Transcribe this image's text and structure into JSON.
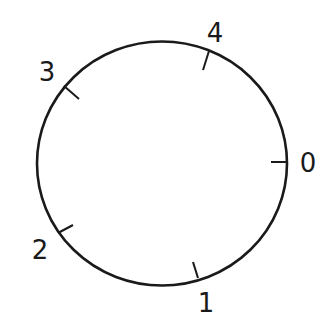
{
  "diagram": {
    "type": "circle-with-ticks",
    "stroke_color": "#1a1a1a",
    "background": "#ffffff",
    "center": {
      "x": 162,
      "y": 163.5
    },
    "radius": {
      "rx": 125,
      "ry": 122
    },
    "ticks": [
      {
        "label": "0",
        "x1": 287,
        "y1": 162,
        "x2": 271,
        "y2": 162,
        "lx": 308,
        "ly": 172
      },
      {
        "label": "1",
        "x1": 198,
        "y1": 278,
        "x2": 193,
        "y2": 262,
        "lx": 206,
        "ly": 312
      },
      {
        "label": "2",
        "x1": 58,
        "y1": 233,
        "x2": 73,
        "y2": 225,
        "lx": 40,
        "ly": 259
      },
      {
        "label": "3",
        "x1": 64,
        "y1": 86,
        "x2": 79,
        "y2": 99,
        "lx": 47,
        "ly": 81
      },
      {
        "label": "4",
        "x1": 209,
        "y1": 51,
        "x2": 203,
        "y2": 70,
        "lx": 215,
        "ly": 42
      }
    ]
  }
}
